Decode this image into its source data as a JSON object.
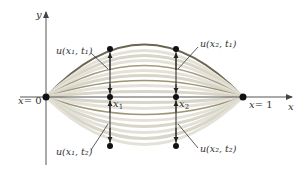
{
  "diagram": {
    "axes": {
      "x_label": "x",
      "y_label": "y"
    },
    "endpoints": {
      "left": {
        "label_var": "x",
        "label_eq": "= 0",
        "label": "x = 0"
      },
      "right": {
        "label_var": "x",
        "label_eq": "= 1",
        "label": "x = 1"
      }
    },
    "positions": {
      "x1": {
        "var": "x",
        "sub": "1"
      },
      "x2": {
        "var": "x",
        "sub": "2"
      }
    },
    "point_labels": {
      "u_x1_t1": "u(x₁, t₁)",
      "u_x2_t1": "u(x₂, t₁)",
      "u_x1_t2": "u(x₁, t₂)",
      "u_x2_t2": "u(x₂, t₂)"
    },
    "colors": {
      "axis": "#555555",
      "outer_curve": "#6b6650",
      "inner_curve_dark": "#9c9474",
      "inner_curve_light": "#d8d6c8",
      "point": "#111111"
    }
  }
}
